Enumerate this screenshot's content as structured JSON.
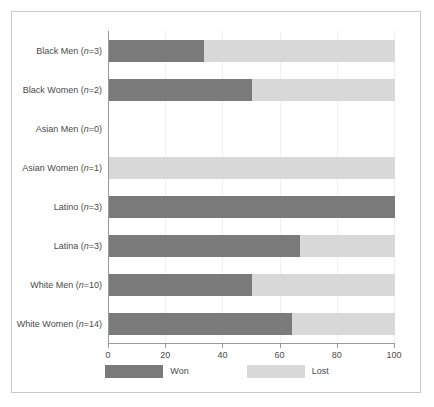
{
  "chart_data": {
    "type": "bar",
    "orientation": "horizontal",
    "stacked": true,
    "stacked_percent": true,
    "title": "",
    "subtitle": "",
    "xlabel": "",
    "ylabel": "",
    "xlim": [
      0,
      100
    ],
    "xticks": [
      0,
      20,
      40,
      60,
      80,
      100
    ],
    "xtick_labels": [
      "0",
      "20",
      "40",
      "60",
      "80",
      "100"
    ],
    "grid": false,
    "legend_position": "bottom",
    "legend": [
      {
        "name": "Won",
        "color": "#7a7a7a"
      },
      {
        "name": "Lost",
        "color": "#d8d8d8"
      }
    ],
    "categories": [
      "Black Men (n=3)",
      "Black Women (n=2)",
      "Asian Men (n=0)",
      "Asian Women (n=1)",
      "Latino (n=3)",
      "Latina (n=3)",
      "White Men (n=10)",
      "White Women (n=14)"
    ],
    "category_parts": [
      {
        "prefix": "Black Men (",
        "italic": "n",
        "suffix": "=3)"
      },
      {
        "prefix": "Black Women (",
        "italic": "n",
        "suffix": "=2)"
      },
      {
        "prefix": "Asian Men (",
        "italic": "n",
        "suffix": "=0)"
      },
      {
        "prefix": "Asian Women (",
        "italic": "n",
        "suffix": "=1)"
      },
      {
        "prefix": "Latino (",
        "italic": "n",
        "suffix": "=3)"
      },
      {
        "prefix": "Latina (",
        "italic": "n",
        "suffix": "=3)"
      },
      {
        "prefix": "White Men (",
        "italic": "n",
        "suffix": "=10)"
      },
      {
        "prefix": "White Women (",
        "italic": "n",
        "suffix": "=14)"
      }
    ],
    "series": [
      {
        "name": "Won",
        "color": "#7a7a7a",
        "values": [
          33.3,
          50,
          0,
          0,
          100,
          66.7,
          50,
          64
        ]
      },
      {
        "name": "Lost",
        "color": "#d8d8d8",
        "values": [
          66.7,
          50,
          0,
          100,
          0,
          33.3,
          50,
          36
        ]
      }
    ]
  },
  "colors": {
    "won": "#7a7a7a",
    "lost": "#d8d8d8",
    "axis": "#9a9a9a",
    "frame": "#c9c9c9",
    "text": "#4a4a4a",
    "background": "#ffffff"
  }
}
